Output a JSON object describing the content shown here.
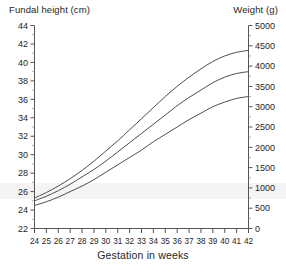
{
  "figure": {
    "left_axis_title": "Fundal height (cm)",
    "right_axis_title": "Weight (g)",
    "x_axis_title": "Gestation in weeks",
    "caption": ""
  },
  "chart_data": {
    "type": "line",
    "title": "",
    "subtitle": "",
    "xlabel": "Gestation in weeks",
    "ylabel": "Fundal height (cm)",
    "y2label": "Weight (g)",
    "xlim": [
      24,
      42
    ],
    "ylim": [
      22,
      44
    ],
    "y2lim": [
      0,
      5000
    ],
    "grid": false,
    "legend": "none",
    "x": [
      24,
      25,
      26,
      27,
      28,
      29,
      30,
      31,
      32,
      33,
      34,
      35,
      36,
      37,
      38,
      39,
      40,
      41,
      42
    ],
    "xticks": [
      "24",
      "25",
      "26",
      "27",
      "28",
      "29",
      "30",
      "31",
      "32",
      "33",
      "34",
      "35",
      "36",
      "37",
      "38",
      "39",
      "40",
      "41",
      "42"
    ],
    "yticks": [
      "22",
      "24",
      "26",
      "28",
      "30",
      "32",
      "34",
      "36",
      "38",
      "40",
      "42",
      "44"
    ],
    "y2ticks": [
      "0",
      "500",
      "1000",
      "1500",
      "2000",
      "2500",
      "3000",
      "3500",
      "4000",
      "4500",
      "5000"
    ],
    "y_tick_step": 2,
    "y2_tick_step": 500,
    "series": [
      {
        "name": "90th centile",
        "values": [
          25.3,
          25.9,
          26.6,
          27.4,
          28.3,
          29.3,
          30.4,
          31.5,
          32.7,
          33.9,
          35.1,
          36.3,
          37.4,
          38.4,
          39.3,
          40.1,
          40.7,
          41.1,
          41.3
        ]
      },
      {
        "name": "50th centile",
        "values": [
          25.0,
          25.5,
          26.1,
          26.8,
          27.6,
          28.4,
          29.3,
          30.3,
          31.3,
          32.3,
          33.3,
          34.3,
          35.3,
          36.2,
          37.0,
          37.8,
          38.4,
          38.8,
          39.0
        ]
      },
      {
        "name": "10th centile",
        "values": [
          24.5,
          24.9,
          25.4,
          26.0,
          26.6,
          27.3,
          28.1,
          28.9,
          29.7,
          30.5,
          31.4,
          32.2,
          33.0,
          33.8,
          34.5,
          35.2,
          35.7,
          36.1,
          36.3
        ]
      }
    ],
    "series_weight_equivalent_g": [
      {
        "name": "90th centile",
        "values": [
          750,
          890,
          1050,
          1230,
          1430,
          1660,
          1910,
          2160,
          2430,
          2700,
          2980,
          3250,
          3500,
          3730,
          3930,
          4110,
          4250,
          4340,
          4390
        ]
      },
      {
        "name": "50th centile",
        "values": [
          680,
          790,
          930,
          1090,
          1270,
          1460,
          1660,
          1890,
          2110,
          2340,
          2570,
          2800,
          3020,
          3230,
          3410,
          3590,
          3730,
          3820,
          3860
        ]
      },
      {
        "name": "10th centile",
        "values": [
          570,
          660,
          770,
          910,
          1050,
          1210,
          1390,
          1570,
          1750,
          1930,
          2130,
          2320,
          2500,
          2680,
          2840,
          2990,
          3110,
          3200,
          3250
        ]
      }
    ],
    "colors": {
      "curve": "#4d4d4d",
      "axis": "#555555",
      "text": "#262626",
      "background": "#ffffff"
    }
  }
}
